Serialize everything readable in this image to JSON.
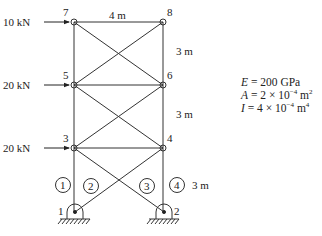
{
  "nodes": {
    "n1": "1",
    "n2": "2",
    "n3": "3",
    "n4": "4",
    "n5": "5",
    "n6": "6",
    "n7": "7",
    "n8": "8"
  },
  "members": {
    "m1": "1",
    "m2": "2",
    "m3": "3",
    "m4": "4"
  },
  "loads": {
    "node7": "10 kN",
    "node5": "20 kN",
    "node3": "20 kN"
  },
  "dimensions": {
    "width_top": "4 m",
    "height_upper": "3 m",
    "height_middle": "3 m",
    "height_lower": "3 m"
  },
  "properties": {
    "E_sym": "E",
    "E_val": " = 200 GPa",
    "A_sym": "A",
    "A_val": " = 2 × 10",
    "A_exp": "−4",
    "A_unit": " m",
    "A_unit_exp": "2",
    "I_sym": "I",
    "I_val": " = 4 × 10",
    "I_exp": "−4",
    "I_unit": " m",
    "I_unit_exp": "4"
  }
}
